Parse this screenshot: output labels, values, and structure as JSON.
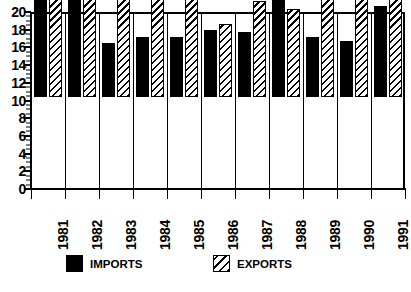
{
  "chart_data": {
    "type": "bar",
    "title": "",
    "xlabel": "",
    "ylabel": "",
    "categories": [
      "1981",
      "1982",
      "1983",
      "1984",
      "1985",
      "1986",
      "1987",
      "1988",
      "1989",
      "1990",
      "1991"
    ],
    "series": [
      {
        "name": "IMPORTS",
        "values": [
          12.0,
          14.0,
          6.1,
          6.8,
          6.8,
          7.6,
          7.3,
          12.3,
          6.8,
          6.3,
          10.3
        ]
      },
      {
        "name": "EXPORTS",
        "values": [
          20.0,
          16.0,
          15.0,
          16.0,
          15.0,
          8.3,
          10.9,
          10.0,
          13.0,
          16.6,
          15.0
        ]
      }
    ],
    "ylim": [
      0,
      20
    ],
    "y_major_ticks": [
      0,
      2,
      4,
      6,
      8,
      10,
      12,
      14,
      16,
      18,
      20
    ],
    "y_tick_labels": [
      "0",
      "2",
      "4",
      "6",
      "8",
      "10",
      "12",
      "14",
      "16",
      "18",
      "20"
    ],
    "y_minor_tick_step": 0.5,
    "grid": false,
    "legend_position": "bottom",
    "colors": {
      "imports": "#000000",
      "exports_hatch": "#000000",
      "background": "#ffffff",
      "axis": "#000000"
    }
  },
  "legend": {
    "items": [
      {
        "label": "IMPORTS",
        "swatch": "solid-black-square-icon"
      },
      {
        "label": "EXPORTS",
        "swatch": "diagonal-hatch-square-icon"
      }
    ]
  }
}
